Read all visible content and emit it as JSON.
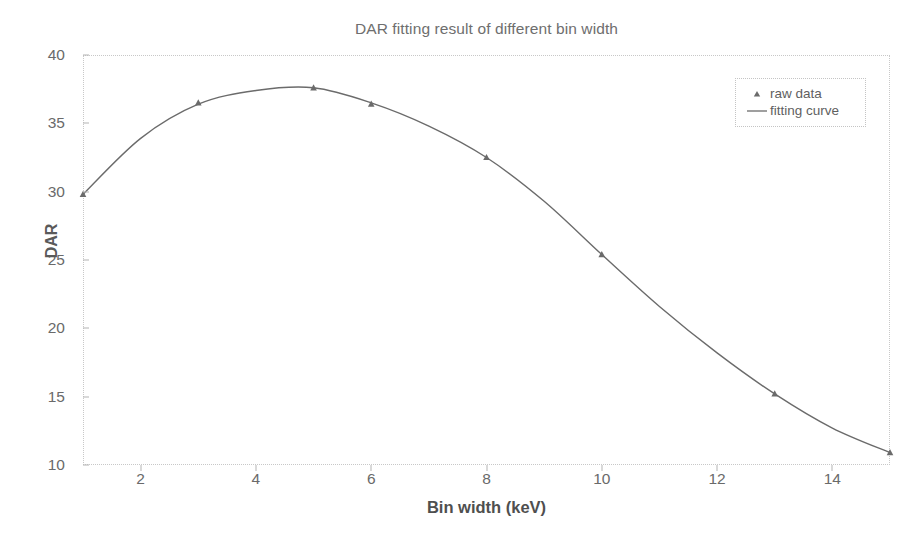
{
  "chart_data": {
    "type": "line",
    "title": "DAR fitting result of different bin width",
    "xlabel": "Bin width (keV)",
    "ylabel": "DAR",
    "xlim": [
      1,
      15
    ],
    "ylim": [
      10,
      40
    ],
    "xticks": [
      2,
      4,
      6,
      8,
      10,
      12,
      14
    ],
    "xtick_labels": [
      "2",
      "4",
      "6",
      "8",
      "10",
      "12",
      "14"
    ],
    "yticks": [
      10,
      15,
      20,
      25,
      30,
      35,
      40
    ],
    "ytick_labels": [
      "10",
      "15",
      "20",
      "25",
      "30",
      "35",
      "40"
    ],
    "grid": false,
    "legend_position": "upper right",
    "series": [
      {
        "name": "raw data",
        "marker": "triangle",
        "color": "#6b6b6b",
        "x": [
          1,
          3,
          5,
          6,
          8,
          10,
          13,
          15
        ],
        "values": [
          29.8,
          36.5,
          37.6,
          36.4,
          32.5,
          25.4,
          15.2,
          10.9
        ]
      },
      {
        "name": "fitting curve",
        "marker": "line",
        "color": "#6b6b6b",
        "x": [
          1,
          2,
          3,
          4,
          5,
          6,
          7,
          8,
          9,
          10,
          11,
          12,
          13,
          14,
          15
        ],
        "values": [
          29.8,
          33.9,
          36.4,
          37.4,
          37.6,
          36.5,
          34.8,
          32.5,
          29.3,
          25.4,
          21.6,
          18.2,
          15.2,
          12.7,
          10.9
        ]
      }
    ]
  },
  "legend": {
    "items": [
      {
        "label": "raw data",
        "symbol": "triangle-marker"
      },
      {
        "label": "fitting curve",
        "symbol": "line-marker"
      }
    ]
  },
  "colors": {
    "curve": "#6b6b6b",
    "marker": "#6b6b6b",
    "axis": "#c8c8c8",
    "text": "#6a6a6a",
    "background": "#ffffff"
  }
}
